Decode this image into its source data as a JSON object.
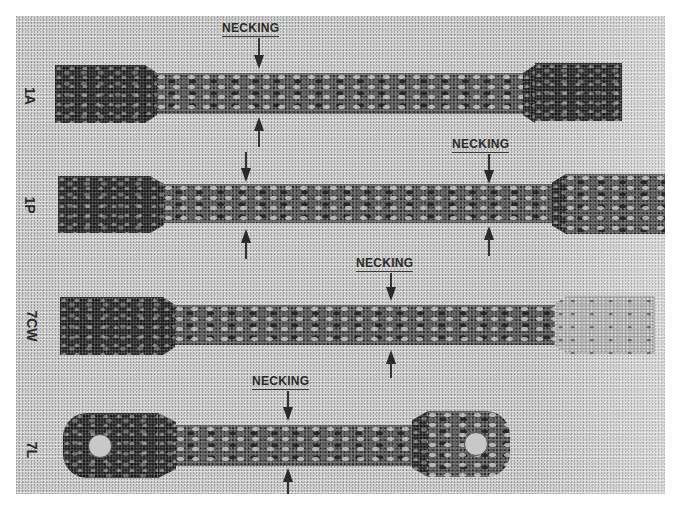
{
  "figure": {
    "specimens": [
      {
        "id": "1A",
        "label": "1A",
        "necking_label": "NECKING",
        "necking_count": 1
      },
      {
        "id": "1P",
        "label": "1P",
        "necking_label": "NECKING",
        "necking_count": 2
      },
      {
        "id": "7CW",
        "label": "7CW",
        "necking_label": "NECKING",
        "necking_count": 1
      },
      {
        "id": "7L",
        "label": "7L",
        "necking_label": "NECKING",
        "necking_count": 1
      }
    ],
    "annotations": {
      "necking_text": "NECKING"
    },
    "colors": {
      "background": "#cfcfcf",
      "specimen_dark": "#2a2a2a",
      "text": "#2a2a2a"
    }
  }
}
